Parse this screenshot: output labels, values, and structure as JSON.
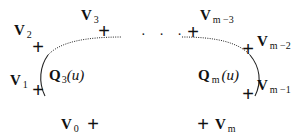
{
  "diagram": {
    "type": "piecewise-curve-control-points",
    "control_points": [
      {
        "id": "v0",
        "symbol": "V",
        "subscript": "0"
      },
      {
        "id": "v1",
        "symbol": "V",
        "subscript": "1"
      },
      {
        "id": "v2",
        "symbol": "V",
        "subscript": "2"
      },
      {
        "id": "v3",
        "symbol": "V",
        "subscript": "3"
      },
      {
        "id": "vm3",
        "symbol": "V",
        "subscript": "m −3"
      },
      {
        "id": "vm2",
        "symbol": "V",
        "subscript": "m −2"
      },
      {
        "id": "vm1",
        "symbol": "V",
        "subscript": "m −1"
      },
      {
        "id": "vm",
        "symbol": "V",
        "subscript": "m"
      }
    ],
    "curves": [
      {
        "id": "q3",
        "symbol": "Q",
        "subscript": "3",
        "arg": "(u)"
      },
      {
        "id": "qm",
        "symbol": "Q",
        "subscript": "m",
        "arg": "(u)"
      }
    ],
    "marker": "+",
    "ellipsis": "· · ·",
    "colors": {
      "ink": "#111111",
      "background": "#ffffff"
    }
  }
}
